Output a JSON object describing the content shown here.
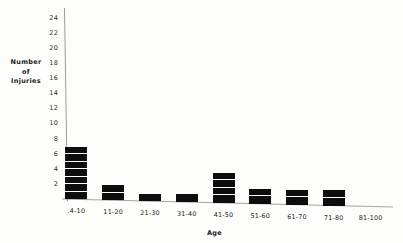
{
  "chart_data": {
    "type": "bar",
    "title": "",
    "xlabel": "Age",
    "ylabel": "Number of Injuries",
    "ylabel_lines": [
      "Number",
      "of",
      "Injuries"
    ],
    "categories": [
      ".4-10",
      "11-20",
      "21-30",
      "31-40",
      "41-50",
      "51-60",
      "61-70",
      "71-80",
      "81-100"
    ],
    "values": [
      7,
      2,
      1,
      1,
      4,
      2,
      2,
      2,
      0
    ],
    "ylim": [
      0,
      25
    ],
    "yticks": [
      2,
      4,
      6,
      8,
      10,
      12,
      14,
      16,
      18,
      20,
      22,
      24
    ],
    "grid": false,
    "legend": null,
    "bar_color": "#0d0d0d",
    "axis_color": "#9a9a99",
    "segmented_bars": true
  }
}
